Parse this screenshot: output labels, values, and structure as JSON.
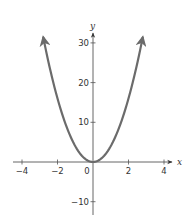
{
  "chart_data": {
    "type": "line",
    "title": "",
    "xlabel": "x",
    "ylabel": "y",
    "function": "y = 4x^2",
    "xlim": [
      -4.2,
      4.2
    ],
    "ylim": [
      -10,
      33
    ],
    "grid": false,
    "legend": null,
    "x_ticks": [
      -4,
      -2,
      0,
      2,
      4
    ],
    "x_tick_labels": [
      "−4",
      "−2",
      "0",
      "2",
      "4"
    ],
    "y_ticks": [
      30,
      20,
      10,
      -10
    ],
    "y_tick_labels": [
      "30",
      "20",
      "10",
      "−10"
    ],
    "series": [
      {
        "name": "parabola",
        "color": "#6b6b6b",
        "x": [
          -2.8,
          -2.5,
          -2,
          -1.5,
          -1,
          -0.5,
          0,
          0.5,
          1,
          1.5,
          2,
          2.5,
          2.8
        ],
        "y": [
          31.4,
          25,
          16,
          9,
          4,
          1,
          0,
          1,
          4,
          9,
          16,
          25,
          31.4
        ],
        "arrows_at_ends": true
      }
    ]
  },
  "axes": {
    "x_name": "x",
    "y_name": "y",
    "axis_color": "#444444",
    "curve_color": "#6b6b6b"
  }
}
